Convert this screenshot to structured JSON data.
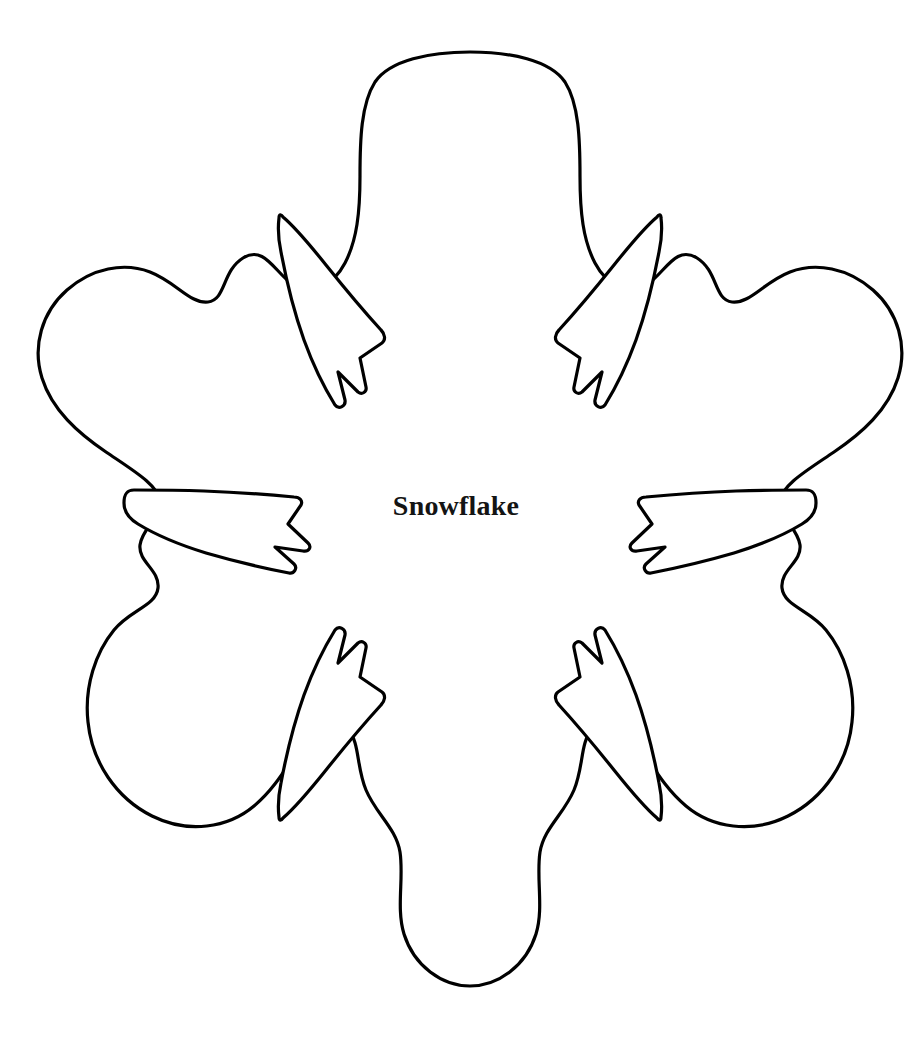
{
  "page": {
    "width": 912,
    "height": 1055,
    "background_color": "#ffffff",
    "title": "Snowflake"
  },
  "label": {
    "text": "Snowflake",
    "color": "#141414",
    "position": "center"
  },
  "figure": {
    "name": "snowflake-template-outline",
    "type": "coloring-page-outline",
    "stroke_color": "#000000",
    "fill_color": "#ffffff",
    "stroke_width": 3.2,
    "symmetry": "6-fold",
    "arm_count": 6,
    "spike_count": 6,
    "bounds": {
      "left": 38,
      "top": 52,
      "right": 874,
      "bottom": 986
    },
    "center": {
      "x": 470,
      "y": 515
    }
  }
}
